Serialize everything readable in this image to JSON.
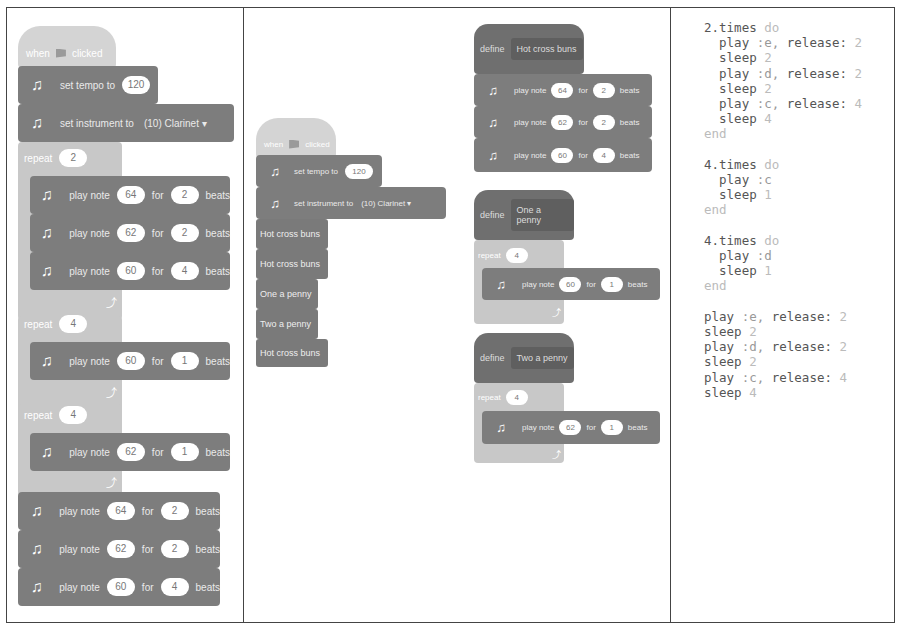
{
  "panels": {
    "panel1": {
      "hat": {
        "prefix": "when",
        "suffix": "clicked"
      },
      "tempo": {
        "label": "set tempo to",
        "value": "120"
      },
      "instrument": {
        "label": "set instrument to",
        "value": "(10) Clarinet ▾"
      },
      "repeat1": {
        "label": "repeat",
        "count": "2",
        "notes": [
          {
            "label": "play note",
            "note": "64",
            "for": "for",
            "beats": "2",
            "unit": "beats"
          },
          {
            "label": "play note",
            "note": "62",
            "for": "for",
            "beats": "2",
            "unit": "beats"
          },
          {
            "label": "play note",
            "note": "60",
            "for": "for",
            "beats": "4",
            "unit": "beats"
          }
        ]
      },
      "repeat2": {
        "label": "repeat",
        "count": "4",
        "notes": [
          {
            "label": "play note",
            "note": "60",
            "for": "for",
            "beats": "1",
            "unit": "beats"
          }
        ]
      },
      "repeat3": {
        "label": "repeat",
        "count": "4",
        "notes": [
          {
            "label": "play note",
            "note": "62",
            "for": "for",
            "beats": "1",
            "unit": "beats"
          }
        ]
      },
      "tail": [
        {
          "label": "play note",
          "note": "64",
          "for": "for",
          "beats": "2",
          "unit": "beats"
        },
        {
          "label": "play note",
          "note": "62",
          "for": "for",
          "beats": "2",
          "unit": "beats"
        },
        {
          "label": "play note",
          "note": "60",
          "for": "for",
          "beats": "4",
          "unit": "beats"
        }
      ]
    },
    "panel2": {
      "main": {
        "hat": {
          "prefix": "when",
          "suffix": "clicked"
        },
        "tempo": {
          "label": "set tempo to",
          "value": "120"
        },
        "instrument": {
          "label": "set instrument to",
          "value": "(10) Clarinet ▾"
        },
        "calls": [
          "Hot cross buns",
          "Hot cross buns",
          "One a penny",
          "Two a penny",
          "Hot cross buns"
        ]
      },
      "defs": [
        {
          "define": "define",
          "name": "Hot cross buns",
          "notes": [
            {
              "label": "play note",
              "note": "64",
              "for": "for",
              "beats": "2",
              "unit": "beats"
            },
            {
              "label": "play note",
              "note": "62",
              "for": "for",
              "beats": "2",
              "unit": "beats"
            },
            {
              "label": "play note",
              "note": "60",
              "for": "for",
              "beats": "4",
              "unit": "beats"
            }
          ]
        },
        {
          "define": "define",
          "name": "One a penny",
          "repeat": "repeat",
          "count": "4",
          "notes": [
            {
              "label": "play note",
              "note": "60",
              "for": "for",
              "beats": "1",
              "unit": "beats"
            }
          ]
        },
        {
          "define": "define",
          "name": "Two a penny",
          "repeat": "repeat",
          "count": "4",
          "notes": [
            {
              "label": "play note",
              "note": "62",
              "for": "for",
              "beats": "1",
              "unit": "beats"
            }
          ]
        }
      ]
    },
    "panel3": {
      "code": [
        {
          "indent": "",
          "text": "2.times",
          "dim": " do"
        },
        {
          "indent": "  ",
          "text": "play ",
          "mid": ":e, ",
          "text2": "release: ",
          "dim": "2"
        },
        {
          "indent": "  ",
          "text": "sleep ",
          "dim": "2"
        },
        {
          "indent": "  ",
          "text": "play ",
          "mid": ":d, ",
          "text2": "release: ",
          "dim": "2"
        },
        {
          "indent": "  ",
          "text": "sleep ",
          "dim": "2"
        },
        {
          "indent": "  ",
          "text": "play ",
          "mid": ":c, ",
          "text2": "release: ",
          "dim": "4"
        },
        {
          "indent": "  ",
          "text": "sleep ",
          "dim": "4"
        },
        {
          "indent": "",
          "text": "",
          "dim": "end"
        },
        {
          "indent": "",
          "text": "",
          "dim": ""
        },
        {
          "indent": "",
          "text": "4.times",
          "dim": " do"
        },
        {
          "indent": "  ",
          "text": "play ",
          "mid": ":c"
        },
        {
          "indent": "  ",
          "text": "sleep ",
          "dim": "1"
        },
        {
          "indent": "",
          "text": "",
          "dim": "end"
        },
        {
          "indent": "",
          "text": "",
          "dim": ""
        },
        {
          "indent": "",
          "text": "4.times",
          "dim": " do"
        },
        {
          "indent": "  ",
          "text": "play ",
          "mid": ":d"
        },
        {
          "indent": "  ",
          "text": "sleep ",
          "dim": "1"
        },
        {
          "indent": "",
          "text": "",
          "dim": "end"
        },
        {
          "indent": "",
          "text": "",
          "dim": ""
        },
        {
          "indent": "",
          "text": "play ",
          "mid": ":e, ",
          "text2": "release: ",
          "dim": "2"
        },
        {
          "indent": "",
          "text": "sleep ",
          "dim": "2"
        },
        {
          "indent": "",
          "text": "play ",
          "mid": ":d, ",
          "text2": "release: ",
          "dim": "2"
        },
        {
          "indent": "",
          "text": "sleep ",
          "dim": "2"
        },
        {
          "indent": "",
          "text": "play ",
          "mid": ":c, ",
          "text2": "release: ",
          "dim": "4"
        },
        {
          "indent": "",
          "text": "sleep ",
          "dim": "4"
        }
      ]
    }
  },
  "colors": {
    "block": "#7d7d7d",
    "control": "#c8c8c8",
    "hat": "#d4d4d4",
    "define": "#6f6f6f",
    "border": "#444444"
  }
}
